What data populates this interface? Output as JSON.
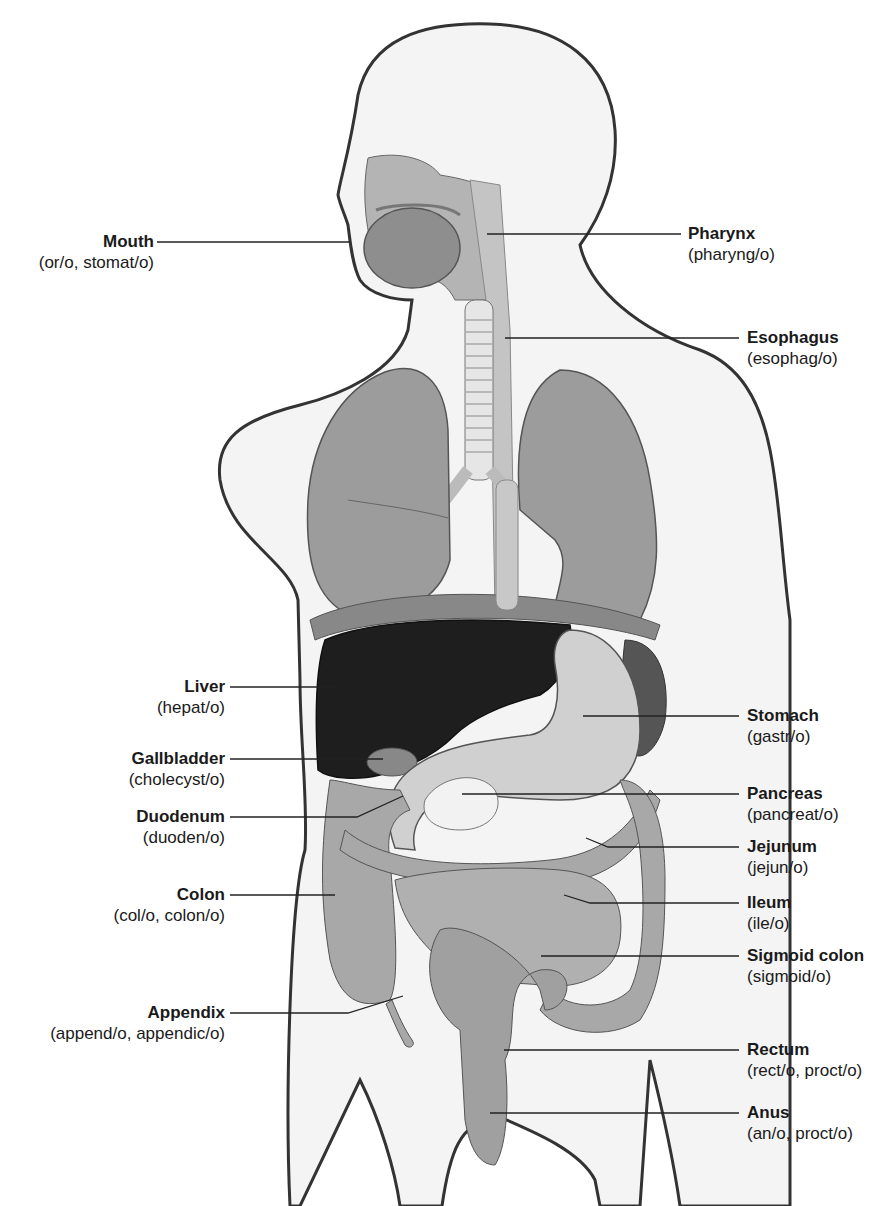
{
  "diagram": {
    "labels_left": [
      {
        "id": "mouth",
        "name": "Mouth",
        "roots": "(or/o, stomat/o)"
      },
      {
        "id": "liver",
        "name": "Liver",
        "roots": "(hepat/o)"
      },
      {
        "id": "gallbladder",
        "name": "Gallbladder",
        "roots": "(cholecyst/o)"
      },
      {
        "id": "duodenum",
        "name": "Duodenum",
        "roots": "(duoden/o)"
      },
      {
        "id": "colon",
        "name": "Colon",
        "roots": "(col/o, colon/o)"
      },
      {
        "id": "appendix",
        "name": "Appendix",
        "roots": "(append/o, appendic/o)"
      }
    ],
    "labels_right": [
      {
        "id": "pharynx",
        "name": "Pharynx",
        "roots": "(pharyng/o)"
      },
      {
        "id": "esophagus",
        "name": "Esophagus",
        "roots": "(esophag/o)"
      },
      {
        "id": "stomach",
        "name": "Stomach",
        "roots": "(gastr/o)"
      },
      {
        "id": "pancreas",
        "name": "Pancreas",
        "roots": "(pancreat/o)"
      },
      {
        "id": "jejunum",
        "name": "Jejunum",
        "roots": "(jejun/o)"
      },
      {
        "id": "ileum",
        "name": "Ileum",
        "roots": "(ile/o)"
      },
      {
        "id": "sigmoid-colon",
        "name": "Sigmoid colon",
        "roots": "(sigmoid/o)"
      },
      {
        "id": "rectum",
        "name": "Rectum",
        "roots": "(rect/o, proct/o)"
      },
      {
        "id": "anus",
        "name": "Anus",
        "roots": "(an/o, proct/o)"
      }
    ],
    "colors": {
      "outline": "#333333",
      "skin": "#f4f4f4",
      "lung": "#9a9a9a",
      "liver": "#1e1e1e",
      "stomach": "#d0d0d0",
      "intestine": "#a8a8a8",
      "pancreas": "#f2f2f2",
      "leader": "#222222"
    }
  }
}
